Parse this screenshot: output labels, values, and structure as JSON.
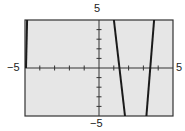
{
  "chart_data": {
    "type": "line",
    "title": "",
    "xlabel": "",
    "ylabel": "",
    "xlim": [
      -5,
      5
    ],
    "ylim": [
      -5,
      5
    ],
    "x_tick_step": 1,
    "y_tick_step": 1,
    "grid": false,
    "background_color": "#e6e6e6",
    "line_color": "#1a1a1a",
    "axis_labels": {
      "x_min": "−5",
      "x_max": "5",
      "y_max": "5",
      "y_min": "−5"
    },
    "series": [
      {
        "name": "branch-left",
        "points": [
          [
            -4.86,
            5
          ],
          [
            -4.93,
            0
          ]
        ]
      },
      {
        "name": "branch-middle",
        "points": [
          [
            1.01,
            5
          ],
          [
            1.76,
            -5
          ]
        ]
      },
      {
        "name": "branch-right",
        "points": [
          [
            3.2,
            -5
          ],
          [
            3.72,
            5
          ]
        ]
      }
    ]
  }
}
